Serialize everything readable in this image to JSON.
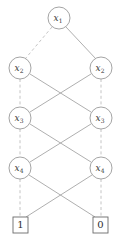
{
  "diagram": {
    "type": "bdd",
    "background_color": "#ffffff",
    "node_stroke_color": "#8d8d8d",
    "solid_edge_color": "#9a9a9a",
    "dashed_edge_color": "#bdbdbd",
    "terminal_stroke_color": "#6b6b6b",
    "label_color": "#3a3a3a",
    "nodes": [
      {
        "id": "n1",
        "var": "x",
        "sub": "1",
        "label": "x1",
        "cx": 59,
        "cy": 18,
        "r": 11,
        "level": 1,
        "side": "center"
      },
      {
        "id": "n2L",
        "var": "x",
        "sub": "2",
        "label": "x2",
        "cx": 20,
        "cy": 68,
        "r": 11,
        "level": 2,
        "side": "left"
      },
      {
        "id": "n2R",
        "var": "x",
        "sub": "2",
        "label": "x2",
        "cx": 101,
        "cy": 68,
        "r": 11,
        "level": 2,
        "side": "right"
      },
      {
        "id": "n3L",
        "var": "x",
        "sub": "3",
        "label": "x3",
        "cx": 20,
        "cy": 118,
        "r": 11,
        "level": 3,
        "side": "left"
      },
      {
        "id": "n3R",
        "var": "x",
        "sub": "3",
        "label": "x3",
        "cx": 101,
        "cy": 118,
        "r": 11,
        "level": 3,
        "side": "right"
      },
      {
        "id": "n4L",
        "var": "x",
        "sub": "4",
        "label": "x4",
        "cx": 20,
        "cy": 168,
        "r": 11,
        "level": 4,
        "side": "left"
      },
      {
        "id": "n4R",
        "var": "x",
        "sub": "4",
        "label": "x4",
        "cx": 101,
        "cy": 168,
        "r": 11,
        "level": 4,
        "side": "right"
      }
    ],
    "terminals": [
      {
        "id": "t1",
        "label": "1",
        "x": 13,
        "y": 217,
        "w": 15,
        "h": 16,
        "side": "left"
      },
      {
        "id": "t0",
        "label": "0",
        "x": 93,
        "y": 217,
        "w": 15,
        "h": 16,
        "side": "right"
      }
    ],
    "edges": [
      {
        "from": "n1",
        "to": "n2L",
        "style": "dashed",
        "x1": 52,
        "y1": 27,
        "x2": 25,
        "y2": 59
      },
      {
        "from": "n1",
        "to": "n2R",
        "style": "solid",
        "x1": 66,
        "y1": 27,
        "x2": 96,
        "y2": 59
      },
      {
        "from": "n2L",
        "to": "n3L",
        "style": "dashed",
        "x1": 20,
        "y1": 79,
        "x2": 20,
        "y2": 107
      },
      {
        "from": "n2R",
        "to": "n3R",
        "style": "dashed",
        "x1": 101,
        "y1": 79,
        "x2": 101,
        "y2": 107
      },
      {
        "from": "n2L",
        "to": "n3R",
        "style": "solid",
        "x1": 30,
        "y1": 74,
        "x2": 91,
        "y2": 112
      },
      {
        "from": "n2R",
        "to": "n3L",
        "style": "solid",
        "x1": 91,
        "y1": 74,
        "x2": 30,
        "y2": 112
      },
      {
        "from": "n3L",
        "to": "n4L",
        "style": "dashed",
        "x1": 20,
        "y1": 129,
        "x2": 20,
        "y2": 157
      },
      {
        "from": "n3R",
        "to": "n4R",
        "style": "dashed",
        "x1": 101,
        "y1": 129,
        "x2": 101,
        "y2": 157
      },
      {
        "from": "n3L",
        "to": "n4R",
        "style": "solid",
        "x1": 30,
        "y1": 124,
        "x2": 91,
        "y2": 162
      },
      {
        "from": "n3R",
        "to": "n4L",
        "style": "solid",
        "x1": 91,
        "y1": 124,
        "x2": 30,
        "y2": 162
      },
      {
        "from": "n4L",
        "to": "t1",
        "style": "dashed",
        "x1": 20,
        "y1": 179,
        "x2": 20,
        "y2": 217
      },
      {
        "from": "n4R",
        "to": "t0",
        "style": "dashed",
        "x1": 101,
        "y1": 179,
        "x2": 101,
        "y2": 217
      },
      {
        "from": "n4L",
        "to": "t0",
        "style": "solid",
        "x1": 29,
        "y1": 175,
        "x2": 95,
        "y2": 217
      },
      {
        "from": "n4R",
        "to": "t1",
        "style": "solid",
        "x1": 92,
        "y1": 175,
        "x2": 26,
        "y2": 217
      }
    ],
    "legend": {
      "dashed_meaning": "low-edge",
      "solid_meaning": "high-edge"
    }
  }
}
